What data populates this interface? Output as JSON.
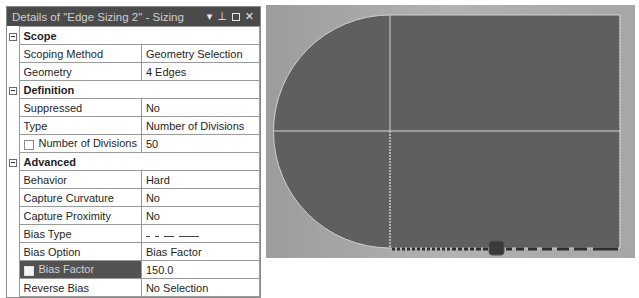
{
  "panel": {
    "title": "Details of \"Edge Sizing 2\" - Sizing",
    "controls": {
      "dropdown": "▾",
      "pin": "⊥",
      "maximize": "",
      "close": "✕"
    },
    "sections": [
      {
        "label": "Scope",
        "rows": [
          {
            "name": "Scoping Method",
            "value": "Geometry Selection"
          },
          {
            "name": "Geometry",
            "value": "4 Edges"
          }
        ]
      },
      {
        "label": "Definition",
        "rows": [
          {
            "name": "Suppressed",
            "value": "No"
          },
          {
            "name": "Type",
            "value": "Number of Divisions"
          },
          {
            "name": "Number of Divisions",
            "value": "50",
            "checkbox": true
          }
        ]
      },
      {
        "label": "Advanced",
        "rows": [
          {
            "name": "Behavior",
            "value": "Hard"
          },
          {
            "name": "Capture Curvature",
            "value": "No"
          },
          {
            "name": "Capture Proximity",
            "value": "No"
          },
          {
            "name": "Bias Type",
            "value": "_ _ ___ _____"
          },
          {
            "name": "Bias Option",
            "value": "Bias Factor"
          },
          {
            "name": "Bias Factor",
            "value": "150.0",
            "checkbox": true,
            "selected": true
          },
          {
            "name": "Reverse Bias",
            "value": "No Selection"
          }
        ]
      }
    ]
  },
  "viewport": {
    "background": "#a8a8a8",
    "body_fill": "#5f5f5f",
    "edge_color": "#d8d8d8",
    "selected_edge_color": "#2e2e2e"
  }
}
